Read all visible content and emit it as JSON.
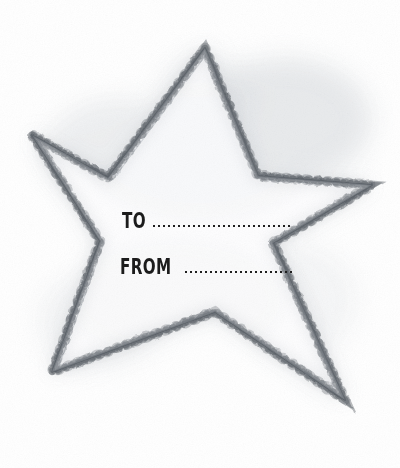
{
  "page": {
    "width": 400,
    "height": 468,
    "background_color": "#ffffff",
    "medium": "pencil and watercolor sketch"
  },
  "artwork": {
    "name": "hand-drawn five-pointed star gift tag",
    "description": "A soft pencil-sketched five-pointed star with stitched cross-hatched outlines and light gray watercolor shading around its edges, drawn on white paper.",
    "outline_color": "#8a8d92",
    "stitch_color": "#4a4d52",
    "shading_color": "#c9ccd1",
    "fill_color": "#fcfcfd",
    "star_points": [
      {
        "name": "top-point",
        "x": 205,
        "y": 48
      },
      {
        "name": "right-inner-upper",
        "x": 258,
        "y": 176
      },
      {
        "name": "right-point",
        "x": 372,
        "y": 185
      },
      {
        "name": "right-inner-lower",
        "x": 273,
        "y": 243
      },
      {
        "name": "bottom-right-point",
        "x": 345,
        "y": 400
      },
      {
        "name": "bottom-inner",
        "x": 215,
        "y": 312
      },
      {
        "name": "bottom-left-point",
        "x": 52,
        "y": 372
      },
      {
        "name": "left-inner-lower",
        "x": 100,
        "y": 241
      },
      {
        "name": "left-point",
        "x": 32,
        "y": 135
      },
      {
        "name": "left-inner-upper",
        "x": 108,
        "y": 178
      }
    ]
  },
  "fields": {
    "to": {
      "label": "TO",
      "value": "",
      "placeholder": "",
      "dotted_rule": true
    },
    "from": {
      "label": "FROM",
      "value": "",
      "placeholder": "",
      "dotted_rule": true
    }
  }
}
